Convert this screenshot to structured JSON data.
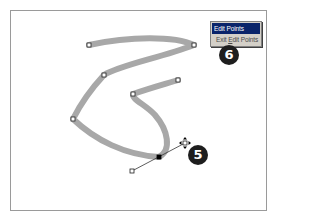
{
  "context_menu": {
    "items": [
      {
        "label": "Edit Points",
        "state": "highlighted"
      },
      {
        "label_prefix": "Exit ",
        "label_underlined": "E",
        "label_suffix": "dit Points",
        "label": "Exit Edit Points"
      }
    ]
  },
  "callouts": [
    {
      "number": "5",
      "target": "bezier-handle"
    },
    {
      "number": "6",
      "target": "context-menu"
    }
  ],
  "shape": {
    "stroke_color": "#a8a8a8",
    "vertices": [
      {
        "x": 89,
        "y": 45
      },
      {
        "x": 194,
        "y": 45
      },
      {
        "x": 104,
        "y": 75
      },
      {
        "x": 73,
        "y": 119
      },
      {
        "x": 159,
        "y": 157,
        "selected": true
      },
      {
        "x": 133,
        "y": 94
      },
      {
        "x": 178,
        "y": 80
      }
    ],
    "handles": [
      {
        "x": 132,
        "y": 171
      },
      {
        "x": 185,
        "y": 143,
        "cursor": "move"
      }
    ]
  },
  "colors": {
    "menu_highlight": "#0a246a",
    "menu_bg": "#d4d0c8",
    "badge_bg": "#1e1e1e"
  }
}
